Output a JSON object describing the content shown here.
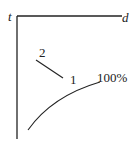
{
  "diagram": {
    "axes": {
      "vertical_label": "t",
      "horizontal_label": "d"
    },
    "labels": {
      "segment_start": "2",
      "segment_end": "1",
      "curve_end": "100%"
    },
    "colors": {
      "stroke": "#222222",
      "background": "#ffffff"
    }
  }
}
